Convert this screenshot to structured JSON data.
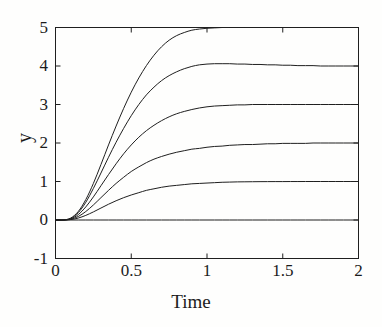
{
  "chart_data": {
    "type": "line",
    "title": "",
    "subtitle": "",
    "xlabel": "Time",
    "ylabel": "y",
    "xlim": [
      0,
      2
    ],
    "ylim": [
      -1,
      5
    ],
    "xticks": [
      0,
      0.5,
      1,
      1.5,
      2
    ],
    "xticklabels": [
      "0",
      "0.5",
      "1",
      "1.5",
      "2"
    ],
    "yticks": [
      -1,
      0,
      1,
      2,
      3,
      4,
      5
    ],
    "yticklabels": [
      "-1",
      "0",
      "1",
      "2",
      "3",
      "4",
      "5"
    ],
    "grid": false,
    "legend": null,
    "legend_position": "none",
    "box": true,
    "line_color": "#1f1f1f",
    "line_width": 1.0,
    "background": "#fefefd",
    "annotations": [],
    "x": [
      0,
      0.05,
      0.1,
      0.15,
      0.2,
      0.25,
      0.3,
      0.35,
      0.4,
      0.45,
      0.5,
      0.55,
      0.6,
      0.65,
      0.7,
      0.75,
      0.8,
      0.85,
      0.9,
      0.95,
      1,
      1.05,
      1.1,
      1.15,
      1.2,
      1.25,
      1.3,
      1.35,
      1.4,
      1.45,
      1.5,
      1.55,
      1.6,
      1.65,
      1.7,
      1.75,
      1.8,
      1.85,
      1.9,
      1.95,
      2
    ],
    "series": [
      {
        "name": "steady-state 0",
        "steady_state": 0,
        "values": [
          0,
          0,
          0,
          0,
          0,
          0,
          0,
          0,
          0,
          0,
          0,
          0,
          0,
          0,
          0,
          0,
          0,
          0,
          0,
          0,
          0,
          0,
          0,
          0,
          0,
          0,
          0,
          0,
          0,
          0,
          0,
          0,
          0,
          0,
          0,
          0,
          0,
          0,
          0,
          0,
          0
        ]
      },
      {
        "name": "steady-state 1",
        "steady_state": 1,
        "values": [
          0,
          0,
          0.01,
          0.05,
          0.12,
          0.21,
          0.31,
          0.41,
          0.5,
          0.58,
          0.65,
          0.71,
          0.77,
          0.81,
          0.85,
          0.88,
          0.9,
          0.92,
          0.94,
          0.95,
          0.96,
          0.97,
          0.98,
          0.985,
          0.99,
          0.992,
          0.994,
          0.996,
          0.997,
          0.998,
          0.998,
          0.999,
          0.999,
          1,
          1,
          1,
          1,
          1,
          1,
          1,
          1
        ]
      },
      {
        "name": "steady-state 2",
        "steady_state": 2,
        "values": [
          0,
          0,
          0.02,
          0.09,
          0.22,
          0.39,
          0.58,
          0.77,
          0.95,
          1.11,
          1.26,
          1.38,
          1.49,
          1.58,
          1.65,
          1.71,
          1.76,
          1.8,
          1.84,
          1.86,
          1.89,
          1.91,
          1.92,
          1.94,
          1.95,
          1.96,
          1.96,
          1.97,
          1.98,
          1.98,
          1.99,
          1.99,
          1.99,
          1.99,
          2,
          2,
          2,
          2,
          2,
          2,
          2
        ]
      },
      {
        "name": "steady-state 3",
        "steady_state": 3,
        "values": [
          0,
          0,
          0.03,
          0.14,
          0.34,
          0.6,
          0.89,
          1.18,
          1.46,
          1.72,
          1.95,
          2.15,
          2.32,
          2.46,
          2.58,
          2.68,
          2.76,
          2.82,
          2.87,
          2.91,
          2.94,
          2.96,
          2.97,
          2.98,
          2.99,
          2.99,
          3,
          3,
          3,
          3,
          3,
          3,
          3,
          3,
          3,
          3,
          3,
          3,
          3,
          3,
          3
        ]
      },
      {
        "name": "steady-state 4",
        "steady_state": 4,
        "values": [
          0,
          0,
          0.04,
          0.19,
          0.46,
          0.82,
          1.22,
          1.63,
          2.02,
          2.38,
          2.71,
          3,
          3.25,
          3.45,
          3.62,
          3.75,
          3.85,
          3.93,
          3.99,
          4.03,
          4.05,
          4.06,
          4.06,
          4.06,
          4.05,
          4.05,
          4.04,
          4.04,
          4.03,
          4.03,
          4.02,
          4.02,
          4.01,
          4.01,
          4.01,
          4,
          4,
          4,
          4,
          4,
          4
        ]
      },
      {
        "name": "steady-state 5",
        "steady_state": 5,
        "values": [
          0,
          0,
          0.05,
          0.22,
          0.53,
          0.95,
          1.44,
          1.95,
          2.44,
          2.9,
          3.32,
          3.69,
          4.01,
          4.28,
          4.5,
          4.67,
          4.79,
          4.87,
          4.93,
          4.96,
          4.98,
          4.99,
          5,
          5,
          5,
          5,
          5,
          5,
          5,
          5,
          5,
          5,
          5,
          5,
          5,
          5,
          5,
          5,
          5,
          5,
          5
        ]
      }
    ]
  }
}
